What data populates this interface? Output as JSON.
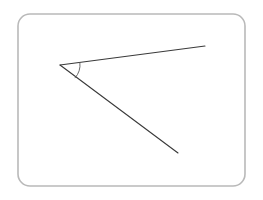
{
  "figure": {
    "name": "angle-diagram",
    "background_color": "#ffffff",
    "frame": {
      "name": "rounded-rectangle-frame",
      "x": 18,
      "y": 14,
      "width": 227,
      "height": 172,
      "corner_radius": 12,
      "stroke_color": "#b9b9b9",
      "stroke_width": 1.6,
      "fill": "none"
    },
    "vertex": {
      "name": "angle-vertex",
      "x": 60,
      "y": 65
    },
    "rays": [
      {
        "name": "upper-ray",
        "from_x": 60,
        "from_y": 65,
        "to_x": 205,
        "to_y": 46,
        "stroke_color": "#3a3a3a",
        "stroke_width": 1.1
      },
      {
        "name": "lower-ray",
        "from_x": 60,
        "from_y": 65,
        "to_x": 178,
        "to_y": 153,
        "stroke_color": "#3a3a3a",
        "stroke_width": 1.1
      }
    ],
    "angle_arc": {
      "name": "angle-arc",
      "center_x": 60,
      "center_y": 65,
      "radius": 20,
      "start_x": 79.87,
      "start_y": 62.39,
      "end_x": 74.86,
      "end_y": 78.08,
      "stroke_color": "#5a5a5a",
      "stroke_width": 0.9,
      "fill": "none"
    }
  }
}
